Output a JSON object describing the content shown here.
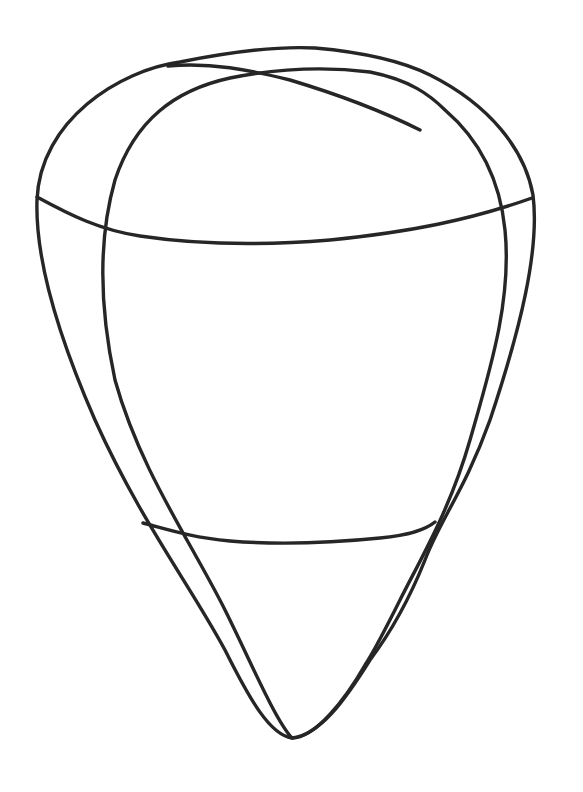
{
  "diagram": {
    "title": "",
    "stroke_color": "#262626",
    "background_color": "#ffffff",
    "shapes": [
      {
        "name": "outer-outline",
        "kind": "teardrop"
      },
      {
        "name": "inner-outline",
        "kind": "teardrop"
      },
      {
        "name": "upper-band",
        "kind": "curve"
      },
      {
        "name": "lower-band",
        "kind": "curve"
      }
    ]
  }
}
